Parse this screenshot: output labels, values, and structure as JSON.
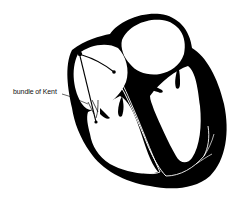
{
  "diagram": {
    "labels": [
      {
        "id": "bundle-of-kent",
        "text": "bundle of Kent",
        "x": 13,
        "y": 92
      }
    ],
    "colors": {
      "muscle": "#000000",
      "background": "#ffffff",
      "conduction_path": "#ffffff",
      "label_text": "#111111"
    }
  }
}
